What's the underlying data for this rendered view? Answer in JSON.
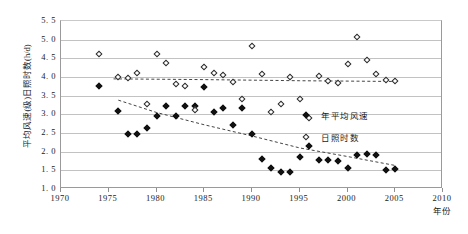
{
  "chart_data": {
    "type": "scatter",
    "title": "",
    "xlabel": "年份",
    "ylabel": "平均风速(级)日照时数(h/d)",
    "xlim": [
      1970,
      2010
    ],
    "ylim": [
      1.0,
      5.5
    ],
    "xticks": [
      1970,
      1975,
      1980,
      1985,
      1990,
      1995,
      2000,
      2005,
      2010
    ],
    "yticks": [
      "1.0",
      "1.5",
      "2.0",
      "2.5",
      "3.0",
      "3.5",
      "4.0",
      "4.5",
      "5.0",
      "5.5"
    ],
    "grid": true,
    "legend_position": "right-middle",
    "series": [
      {
        "name": "年平均风速",
        "marker": "filled-diamond",
        "color": "#111111",
        "points": [
          {
            "x": 1974,
            "y": 3.76
          },
          {
            "x": 1976,
            "y": 3.1
          },
          {
            "x": 1977,
            "y": 2.47
          },
          {
            "x": 1978,
            "y": 2.47
          },
          {
            "x": 1979,
            "y": 2.63
          },
          {
            "x": 1980,
            "y": 2.96
          },
          {
            "x": 1981,
            "y": 3.22
          },
          {
            "x": 1982,
            "y": 2.95
          },
          {
            "x": 1983,
            "y": 3.23
          },
          {
            "x": 1984,
            "y": 3.22
          },
          {
            "x": 1985,
            "y": 3.73
          },
          {
            "x": 1986,
            "y": 3.05
          },
          {
            "x": 1987,
            "y": 3.17
          },
          {
            "x": 1988,
            "y": 2.72
          },
          {
            "x": 1989,
            "y": 3.18
          },
          {
            "x": 1990,
            "y": 2.46
          },
          {
            "x": 1991,
            "y": 1.8
          },
          {
            "x": 1992,
            "y": 1.57
          },
          {
            "x": 1993,
            "y": 1.45
          },
          {
            "x": 1994,
            "y": 1.45
          },
          {
            "x": 1995,
            "y": 1.87
          },
          {
            "x": 1996,
            "y": 2.16
          },
          {
            "x": 1997,
            "y": 1.78
          },
          {
            "x": 1998,
            "y": 1.79
          },
          {
            "x": 1999,
            "y": 1.74
          },
          {
            "x": 2000,
            "y": 1.56
          },
          {
            "x": 2001,
            "y": 1.92
          },
          {
            "x": 2002,
            "y": 1.93
          },
          {
            "x": 2003,
            "y": 1.91
          },
          {
            "x": 2004,
            "y": 1.52
          },
          {
            "x": 2005,
            "y": 1.53
          }
        ]
      },
      {
        "name": "日照时数",
        "marker": "open-diamond",
        "color": "#2a2a2a",
        "points": [
          {
            "x": 1974,
            "y": 4.62
          },
          {
            "x": 1976,
            "y": 3.99
          },
          {
            "x": 1977,
            "y": 3.98
          },
          {
            "x": 1978,
            "y": 4.11
          },
          {
            "x": 1979,
            "y": 3.29
          },
          {
            "x": 1980,
            "y": 4.62
          },
          {
            "x": 1981,
            "y": 4.37
          },
          {
            "x": 1982,
            "y": 3.81
          },
          {
            "x": 1983,
            "y": 3.75
          },
          {
            "x": 1984,
            "y": 3.12
          },
          {
            "x": 1985,
            "y": 4.27
          },
          {
            "x": 1986,
            "y": 4.1
          },
          {
            "x": 1987,
            "y": 4.05
          },
          {
            "x": 1988,
            "y": 3.87
          },
          {
            "x": 1989,
            "y": 3.4
          },
          {
            "x": 1990,
            "y": 4.84
          },
          {
            "x": 1991,
            "y": 4.07
          },
          {
            "x": 1992,
            "y": 3.05
          },
          {
            "x": 1993,
            "y": 3.28
          },
          {
            "x": 1994,
            "y": 4.0
          },
          {
            "x": 1995,
            "y": 3.42
          },
          {
            "x": 1996,
            "y": 2.9
          },
          {
            "x": 1997,
            "y": 4.02
          },
          {
            "x": 1998,
            "y": 3.9
          },
          {
            "x": 1999,
            "y": 3.85
          },
          {
            "x": 2000,
            "y": 4.35
          },
          {
            "x": 2001,
            "y": 5.08
          },
          {
            "x": 2002,
            "y": 4.45
          },
          {
            "x": 2003,
            "y": 4.08
          },
          {
            "x": 2004,
            "y": 3.92
          },
          {
            "x": 2005,
            "y": 3.9
          }
        ]
      }
    ],
    "trendlines": [
      {
        "name": "日照时数趋势线",
        "style": "dashed",
        "color": "#2f2f2f",
        "points": [
          {
            "x": 1975.5,
            "y": 3.95
          },
          {
            "x": 1985,
            "y": 3.93
          },
          {
            "x": 1995,
            "y": 3.9
          },
          {
            "x": 2005,
            "y": 3.88
          }
        ]
      },
      {
        "name": "年平均风速趋势线",
        "style": "dashed",
        "color": "#2f2f2f",
        "points": [
          {
            "x": 1976,
            "y": 3.38
          },
          {
            "x": 1980,
            "y": 3.05
          },
          {
            "x": 1985,
            "y": 2.72
          },
          {
            "x": 1990,
            "y": 2.42
          },
          {
            "x": 1995,
            "y": 2.1
          },
          {
            "x": 2000,
            "y": 1.87
          },
          {
            "x": 2005,
            "y": 1.63
          }
        ]
      }
    ],
    "legend": [
      {
        "label": "年平均风速",
        "marker": "filled-diamond"
      },
      {
        "label": "日照时数",
        "marker": "open-diamond"
      }
    ]
  }
}
